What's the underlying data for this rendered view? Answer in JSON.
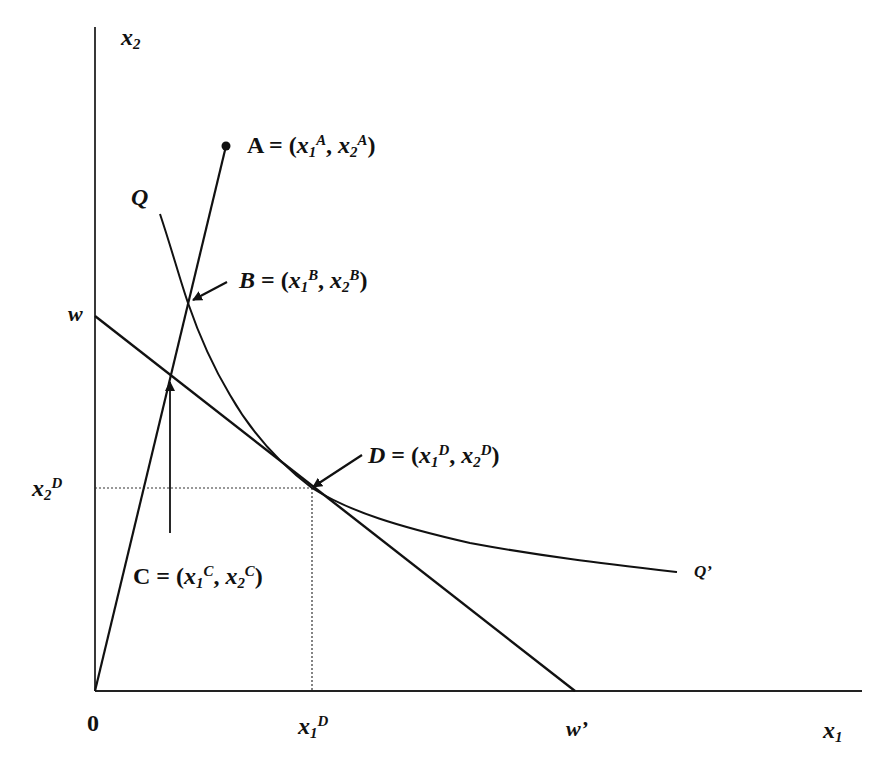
{
  "diagram": {
    "type": "isoquant-budget-diagram",
    "colors": {
      "ink": "#111111",
      "background": "#ffffff"
    },
    "axes": {
      "origin_label": "0",
      "x_axis_label": {
        "base": "x",
        "sub": "1"
      },
      "y_axis_label": {
        "base": "x",
        "sub": "2"
      }
    },
    "y_ticks": [
      {
        "name": "w",
        "label": "w"
      },
      {
        "name": "x2D",
        "base": "x",
        "sub": "2",
        "sup": "D"
      }
    ],
    "x_ticks": [
      {
        "name": "x1D",
        "base": "x",
        "sub": "1",
        "sup": "D"
      },
      {
        "name": "w_prime",
        "label": "w’"
      }
    ],
    "curves": {
      "isoquant_start_label": "Q",
      "isoquant_end_label": "Q’"
    },
    "points": {
      "A": {
        "letter": "A",
        "eq": " = (",
        "x": "x",
        "s1": "1",
        "p1": "A",
        "comma": ", ",
        "x2": "x",
        "s2": "2",
        "p2": "A",
        "close": ")"
      },
      "B": {
        "letter": "B",
        "eq": " = (",
        "x": "x",
        "s1": "1",
        "p1": "B",
        "comma": ", ",
        "x2": "x",
        "s2": "2",
        "p2": "B",
        "close": ")"
      },
      "C": {
        "letter": "C",
        "eq": " = (",
        "x": "x",
        "s1": "1",
        "p1": "C",
        "comma": ", ",
        "x2": "x",
        "s2": "2",
        "p2": "C",
        "close": ")"
      },
      "D": {
        "letter": "D",
        "eq": " = (",
        "x": "x",
        "s1": "1",
        "p1": "D",
        "comma": ", ",
        "x2": "x",
        "s2": "2",
        "p2": "D",
        "close": ")"
      }
    }
  }
}
